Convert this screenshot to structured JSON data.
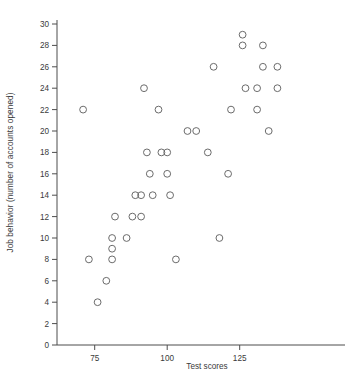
{
  "chart_data": {
    "type": "scatter",
    "title": "",
    "xlabel": "Test scores",
    "ylabel": "Job behavior (number of accounts opened)",
    "xlim": [
      62,
      145
    ],
    "ylim": [
      0,
      30
    ],
    "xticks": [
      75,
      100,
      125
    ],
    "yticks": [
      0,
      2,
      4,
      6,
      8,
      10,
      12,
      14,
      16,
      18,
      20,
      22,
      24,
      26,
      28,
      30
    ],
    "grid": false,
    "legend": null,
    "marker": "open-circle",
    "marker_color": "#6b6b6b",
    "points": [
      {
        "x": 71,
        "y": 22
      },
      {
        "x": 73,
        "y": 8
      },
      {
        "x": 76,
        "y": 4
      },
      {
        "x": 79,
        "y": 6
      },
      {
        "x": 81,
        "y": 10
      },
      {
        "x": 81,
        "y": 9
      },
      {
        "x": 81,
        "y": 8
      },
      {
        "x": 82,
        "y": 12
      },
      {
        "x": 86,
        "y": 10
      },
      {
        "x": 88,
        "y": 12
      },
      {
        "x": 89,
        "y": 14
      },
      {
        "x": 91,
        "y": 12
      },
      {
        "x": 91,
        "y": 14
      },
      {
        "x": 92,
        "y": 24
      },
      {
        "x": 93,
        "y": 18
      },
      {
        "x": 94,
        "y": 16
      },
      {
        "x": 95,
        "y": 14
      },
      {
        "x": 97,
        "y": 22
      },
      {
        "x": 98,
        "y": 18
      },
      {
        "x": 100,
        "y": 16
      },
      {
        "x": 100,
        "y": 18
      },
      {
        "x": 101,
        "y": 14
      },
      {
        "x": 103,
        "y": 8
      },
      {
        "x": 107,
        "y": 20
      },
      {
        "x": 110,
        "y": 20
      },
      {
        "x": 114,
        "y": 18
      },
      {
        "x": 116,
        "y": 26
      },
      {
        "x": 118,
        "y": 10
      },
      {
        "x": 121,
        "y": 16
      },
      {
        "x": 122,
        "y": 22
      },
      {
        "x": 126,
        "y": 29
      },
      {
        "x": 126,
        "y": 28
      },
      {
        "x": 127,
        "y": 24
      },
      {
        "x": 131,
        "y": 22
      },
      {
        "x": 131,
        "y": 24
      },
      {
        "x": 133,
        "y": 28
      },
      {
        "x": 133,
        "y": 26
      },
      {
        "x": 135,
        "y": 20
      },
      {
        "x": 138,
        "y": 24
      },
      {
        "x": 138,
        "y": 26
      }
    ]
  }
}
